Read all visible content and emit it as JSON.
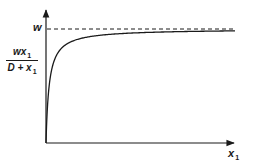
{
  "chart_data": {
    "type": "line",
    "title": "",
    "function": "y = w * x1 / (D + x1)",
    "xlabel": "x1",
    "ylabel": "w x1 / (D + x1)",
    "asymptote": {
      "label": "w",
      "style": "dashed",
      "value": 1.0
    },
    "series": [
      {
        "name": "wx1/(D+x1)",
        "style": "solid",
        "x": [
          0,
          0.05,
          0.1,
          0.2,
          0.4,
          0.6,
          1.0,
          1.5,
          2.0,
          3.0,
          4.0,
          5.0,
          6.0
        ],
        "values": [
          0,
          0.33,
          0.5,
          0.67,
          0.8,
          0.86,
          0.91,
          0.94,
          0.95,
          0.97,
          0.976,
          0.98,
          0.984
        ]
      }
    ],
    "params": {
      "D": 0.1,
      "w": 1.0
    },
    "xlim": [
      0,
      6.5
    ],
    "ylim": [
      0,
      1.15
    ],
    "grid": false,
    "legend": null
  },
  "labels": {
    "asymptote": "w",
    "y_num_var": "wx",
    "y_num_sub": "1",
    "y_den_var": "D + x",
    "y_den_sub": "1",
    "x_var": "x",
    "x_sub": "1"
  },
  "colors": {
    "ink": "#1a1a1a",
    "background": "#ffffff"
  }
}
